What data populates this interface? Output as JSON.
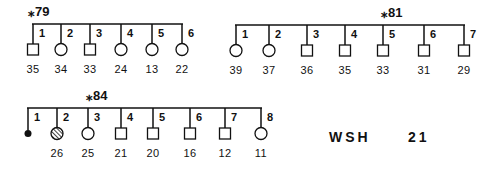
{
  "diagram_type": "pedigree",
  "pedigrees": [
    {
      "label": "⁎79",
      "line_y": 24,
      "label_pos": [
        28,
        16
      ],
      "members": [
        {
          "n": "1",
          "x": 33,
          "sex": "male",
          "status": "unaffected",
          "age": "35"
        },
        {
          "n": "2",
          "x": 61,
          "sex": "female",
          "status": "unaffected",
          "age": "34"
        },
        {
          "n": "3",
          "x": 90,
          "sex": "male",
          "status": "unaffected",
          "age": "33"
        },
        {
          "n": "4",
          "x": 121,
          "sex": "female",
          "status": "unaffected",
          "age": "24"
        },
        {
          "n": "5",
          "x": 152,
          "sex": "female",
          "status": "unaffected",
          "age": "13"
        },
        {
          "n": "6",
          "x": 182,
          "sex": "female",
          "status": "unaffected",
          "age": "22"
        }
      ]
    },
    {
      "label": "⁎81",
      "line_y": 25,
      "label_pos": [
        381,
        17
      ],
      "members": [
        {
          "n": "1",
          "x": 236,
          "sex": "female",
          "status": "unaffected",
          "age": "39"
        },
        {
          "n": "2",
          "x": 269,
          "sex": "female",
          "status": "unaffected",
          "age": "37"
        },
        {
          "n": "3",
          "x": 307,
          "sex": "male",
          "status": "unaffected",
          "age": "36"
        },
        {
          "n": "4",
          "x": 345,
          "sex": "male",
          "status": "unaffected",
          "age": "35"
        },
        {
          "n": "5",
          "x": 383,
          "sex": "male",
          "status": "unaffected",
          "age": "33"
        },
        {
          "n": "6",
          "x": 424,
          "sex": "male",
          "status": "unaffected",
          "age": "31"
        },
        {
          "n": "7",
          "x": 464,
          "sex": "male",
          "status": "unaffected",
          "age": "29"
        }
      ]
    },
    {
      "label": "⁎84",
      "line_y": 108,
      "label_pos": [
        86,
        100
      ],
      "members": [
        {
          "n": "1",
          "x": 28,
          "sex": "deceased-dot",
          "status": "deceased",
          "age": ""
        },
        {
          "n": "2",
          "x": 57,
          "sex": "female",
          "status": "hatched",
          "age": "26"
        },
        {
          "n": "3",
          "x": 88,
          "sex": "female",
          "status": "unaffected",
          "age": "25"
        },
        {
          "n": "4",
          "x": 121,
          "sex": "male",
          "status": "unaffected",
          "age": "21"
        },
        {
          "n": "5",
          "x": 153,
          "sex": "male",
          "status": "unaffected",
          "age": "20"
        },
        {
          "n": "6",
          "x": 190,
          "sex": "male",
          "status": "unaffected",
          "age": "16"
        },
        {
          "n": "7",
          "x": 225,
          "sex": "male",
          "status": "unaffected",
          "age": "12"
        },
        {
          "n": "8",
          "x": 261,
          "sex": "female",
          "status": "unaffected",
          "age": "11"
        }
      ]
    }
  ],
  "family_id": {
    "text": "WSH",
    "number": "21"
  },
  "colors": {
    "ink": "#111111",
    "background": "#ffffff"
  }
}
